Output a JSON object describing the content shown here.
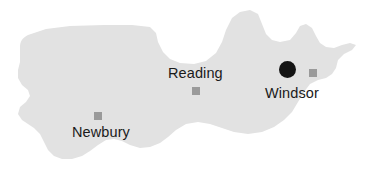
{
  "map": {
    "kind": "region-outline-map",
    "region_fill_color": "#e2e2e2",
    "background_color": "#ffffff",
    "label_color": "#1a1a1a",
    "marker_square_color": "#9a9a9a",
    "highlight_marker_color": "#141414",
    "width": 367,
    "height": 176,
    "cities": [
      {
        "name": "Reading",
        "marker": "square-marker",
        "marker_type": "square",
        "label_x": 168,
        "label_y": 66,
        "marker_x": 192,
        "marker_y": 87,
        "highlighted": false
      },
      {
        "name": "Newbury",
        "marker": "square-marker",
        "marker_type": "square",
        "label_x": 72,
        "label_y": 125,
        "marker_x": 94,
        "marker_y": 112,
        "highlighted": false
      },
      {
        "name": "Windsor",
        "marker": "square-marker",
        "marker_type": "square",
        "label_x": 265,
        "label_y": 86,
        "marker_x": 309,
        "marker_y": 69,
        "highlighted": true,
        "highlight_marker": "filled-circle-marker",
        "highlight_x": 279,
        "highlight_y": 61
      }
    ],
    "outline_path": "M 20,47 C 20,42 22,38 28,35 L 46,29 L 70,26 L 104,25 L 132,25 L 150,27 L 156,33 L 158,42 L 163,52 L 170,59 L 180,63 L 194,64 L 206,61 L 216,53 L 222,42 L 226,30 L 232,18 L 240,12 L 250,10 L 258,14 L 262,24 L 266,34 L 272,40 L 280,42 L 290,40 L 296,33 L 300,26 L 306,24 L 312,28 L 316,36 L 320,43 L 326,47 L 334,48 L 342,45 L 350,43 L 356,45 L 352,50 L 344,54 L 338,60 L 336,68 L 332,74 L 326,78 L 318,80 L 310,84 L 304,92 L 298,102 L 292,112 L 284,120 L 274,127 L 262,132 L 248,134 L 234,132 L 222,128 L 210,124 L 198,122 L 186,124 L 176,130 L 168,137 L 160,143 L 150,147 L 140,148 L 130,145 L 122,141 L 114,139 L 106,140 L 98,145 L 90,151 L 82,156 L 72,159 L 62,159 L 54,156 L 48,150 L 44,142 L 40,134 L 34,128 L 28,124 L 22,120 L 18,114 L 20,107 L 26,102 L 30,96 L 28,90 L 22,85 L 18,78 L 18,70 L 20,62 Z"
  }
}
